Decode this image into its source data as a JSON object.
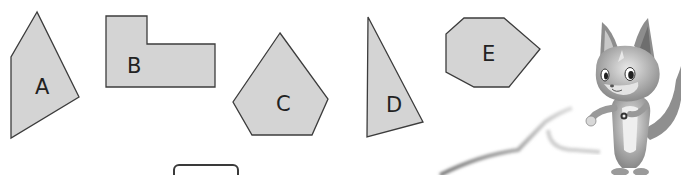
{
  "colors": {
    "shape_fill": "#d4d4d4",
    "shape_stroke": "#3c3c3c",
    "label": "#222222",
    "background": "#ffffff"
  },
  "shapes": [
    {
      "label": "A",
      "type": "quadrilateral",
      "points": "37,12 11,57 11,138 79,97",
      "label_pos": [
        35,
        94
      ]
    },
    {
      "label": "B",
      "type": "L-shaped hexagon",
      "points": "106,16 147,16 147,44 215,44 215,87 106,87",
      "label_pos": [
        127,
        73
      ]
    },
    {
      "label": "C",
      "type": "pentagon",
      "points": "280,33 233,102 252,135 312,135 328,99",
      "label_pos": [
        276,
        111
      ]
    },
    {
      "label": "D",
      "type": "triangle",
      "points": "368,17 367,137 423,122",
      "label_pos": [
        386,
        112
      ]
    },
    {
      "label": "E",
      "type": "heptagon",
      "points": "464,18 504,18 540,49 509,87 474,87 446,72 446,34",
      "label_pos": [
        482,
        61
      ]
    }
  ],
  "answer_box": {
    "value": ""
  },
  "mascot": {
    "description": "cartoon fox character",
    "icon": "fox-mascot-icon"
  }
}
